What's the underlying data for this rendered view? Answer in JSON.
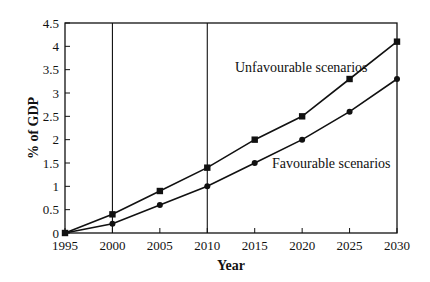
{
  "chart_data": {
    "type": "line",
    "title": "",
    "xlabel": "Year",
    "ylabel": "% of GDP",
    "x": [
      1995,
      2000,
      2005,
      2010,
      2015,
      2020,
      2025,
      2030
    ],
    "x_ticks": [
      "1995",
      "2000",
      "2005",
      "2010",
      "2015",
      "2020",
      "2025",
      "2030"
    ],
    "y_ticks": [
      "0",
      "0.5",
      "1",
      "1.5",
      "2",
      "2.5",
      "3",
      "3.5",
      "4",
      "4.5"
    ],
    "ylim": [
      0,
      4.5
    ],
    "xlim": [
      1995,
      2030
    ],
    "grid": false,
    "vertical_reference_lines": [
      2000,
      2010
    ],
    "series": [
      {
        "name": "Unfavourable scenarios",
        "marker": "square",
        "values": [
          0,
          0.4,
          0.9,
          1.4,
          2.0,
          2.5,
          3.3,
          4.1
        ]
      },
      {
        "name": "Favourable scenarios",
        "marker": "circle",
        "values": [
          0,
          0.2,
          0.6,
          1.0,
          1.5,
          2.0,
          2.6,
          3.3
        ]
      }
    ],
    "annotations": [
      {
        "text": "Unfavourable scenarios",
        "series": 0
      },
      {
        "text": "Favourable scenarios",
        "series": 1
      }
    ],
    "legend": "inline annotations"
  },
  "labels": {
    "xlabel": "Year",
    "ylabel": "% of GDP",
    "unfav": "Unfavourable scenarios",
    "fav": "Favourable scenarios"
  }
}
